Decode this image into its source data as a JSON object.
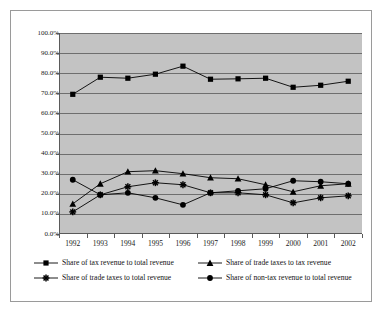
{
  "page": {
    "top_cropped_text": "",
    "background_color": "#ffffff",
    "frame_color": "#9a9a9a"
  },
  "chart_data": {
    "type": "line",
    "title": "",
    "subtitle": "",
    "xlabel": "",
    "ylabel": "",
    "categories": [
      "1992",
      "1993",
      "1994",
      "1995",
      "1996",
      "1997",
      "1998",
      "1999",
      "2000",
      "2001",
      "2002"
    ],
    "x": [
      1992,
      1993,
      1994,
      1995,
      1996,
      1997,
      1998,
      1999,
      2000,
      2001,
      2002
    ],
    "ylim": [
      0,
      100
    ],
    "ytick_values": [
      0,
      10,
      20,
      30,
      40,
      50,
      60,
      70,
      80,
      90,
      100
    ],
    "ytick_labels": [
      "0.0%",
      "10.0%",
      "20.0%",
      "30.0%",
      "40.0%",
      "50.0%",
      "60.0%",
      "70.0%",
      "80.0%",
      "90.0%",
      "100.0%"
    ],
    "grid": true,
    "grid_color": "#6e6e6e",
    "plot_background": "#c3c3c3",
    "legend_position": "bottom",
    "series": [
      {
        "name": "Share of tax revenue to total revenue",
        "marker": "square",
        "color": "#000000",
        "values": [
          69.5,
          78.0,
          77.5,
          79.5,
          83.5,
          77.0,
          77.2,
          77.5,
          73.0,
          74.0,
          76.0
        ]
      },
      {
        "name": "Share of trade taxes to tax revenue",
        "marker": "triangle",
        "color": "#000000",
        "values": [
          15.0,
          25.0,
          31.0,
          31.5,
          30.0,
          28.0,
          27.5,
          24.5,
          21.0,
          24.0,
          25.0
        ]
      },
      {
        "name": "Share of trade taxes to total revenue",
        "marker": "star",
        "color": "#000000",
        "values": [
          11.0,
          19.5,
          23.5,
          25.5,
          24.5,
          20.5,
          20.5,
          19.5,
          15.5,
          18.0,
          19.0
        ]
      },
      {
        "name": "Share of non-tax revenue to total revenue",
        "marker": "circle",
        "color": "#000000",
        "values": [
          27.0,
          19.5,
          20.5,
          18.0,
          14.5,
          20.5,
          21.5,
          22.5,
          26.5,
          26.0,
          25.0
        ]
      }
    ]
  },
  "legend": {
    "items": [
      {
        "label": "Share of tax revenue to total revenue",
        "marker": "square"
      },
      {
        "label": "Share of trade taxes to tax revenue",
        "marker": "triangle"
      },
      {
        "label": "Share of trade taxes to total revenue",
        "marker": "star"
      },
      {
        "label": "Share of non-tax revenue to total revenue",
        "marker": "circle"
      }
    ]
  }
}
